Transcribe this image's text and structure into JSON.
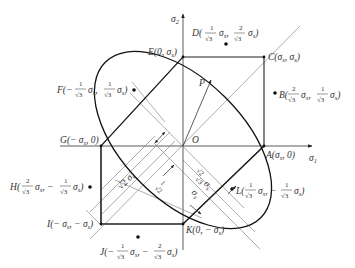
{
  "figure": {
    "axes": {
      "x_label": "σ1",
      "y_label": "σ2",
      "origin_label": "O"
    },
    "load_vector_label": "P",
    "colors": {
      "ink": "#222222",
      "thin": "#555555",
      "dot": "#111111",
      "background": "#ffffff"
    },
    "points": [
      {
        "id": "A",
        "text": "A(σs, 0)"
      },
      {
        "id": "B",
        "text": "B(2/√3 σs, 1/√3 σs)"
      },
      {
        "id": "C",
        "text": "C(σs, σs)"
      },
      {
        "id": "D",
        "text": "D(1/√3 σs, 2/√3 σs)"
      },
      {
        "id": "E",
        "text": "E(0, σs)"
      },
      {
        "id": "F",
        "text": "F(−1/√3 σs, 1/√3 σs)"
      },
      {
        "id": "G",
        "text": "G(−σs, 0)"
      },
      {
        "id": "H",
        "text": "H(−2/√3 σs, −1/√3 σs)"
      },
      {
        "id": "I",
        "text": "I(−σs, −σs)"
      },
      {
        "id": "J",
        "text": "J(−1/√3 σs, −2/√3 σs)"
      },
      {
        "id": "K",
        "text": "K(0, −σs)"
      },
      {
        "id": "L",
        "text": "L(1/√3 σs, −1/√3 σs)"
      }
    ],
    "dimensions": [
      {
        "id": "d1",
        "text": "√2 σs"
      },
      {
        "id": "d2",
        "text": "1/√2 σs"
      },
      {
        "id": "d3",
        "text": "√(2/3) σs"
      },
      {
        "id": "d4",
        "text": "σs"
      }
    ]
  },
  "labels": {
    "sigma": "σ",
    "s": "s",
    "one": "1",
    "two": "2",
    "sqrt3": "√3",
    "sqrt2": "√2",
    "zero": "0",
    "minus": "−",
    "A": "A",
    "B": "B",
    "C": "C",
    "D": "D",
    "E": "E",
    "F": "F",
    "G": "G",
    "H": "H",
    "I": "I",
    "J": "J",
    "K": "K",
    "L": "L",
    "O": "O",
    "P": "P"
  }
}
